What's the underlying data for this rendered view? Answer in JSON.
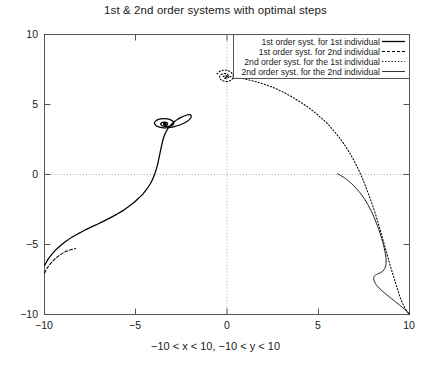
{
  "chart_data": {
    "type": "line",
    "title": "1st & 2nd order systems with optimal steps",
    "xlabel": "−10 < x < 10, −10 < y < 10",
    "ylabel": "",
    "xlim": [
      -10,
      10
    ],
    "ylim": [
      -10,
      10
    ],
    "grid": "zero-axes-dotted",
    "legend_position": "top-right-inside",
    "xticks": [
      "−10",
      "−5",
      "0",
      "5",
      "10"
    ],
    "xtick_values": [
      -10,
      -5,
      0,
      5,
      10
    ],
    "yticks": [
      "10",
      "5",
      "0",
      "−5",
      "−10"
    ],
    "ytick_values": [
      10,
      5,
      0,
      -5,
      -10
    ],
    "series": [
      {
        "name": "1st order syst. for 1st individual",
        "style": "solid",
        "points": [
          [
            -10.0,
            -6.5
          ],
          [
            -9.8,
            -6.05
          ],
          [
            -9.6,
            -5.7
          ],
          [
            -9.35,
            -5.35
          ],
          [
            -9.1,
            -5.05
          ],
          [
            -8.8,
            -4.75
          ],
          [
            -8.5,
            -4.48
          ],
          [
            -8.15,
            -4.22
          ],
          [
            -7.8,
            -3.98
          ],
          [
            -7.45,
            -3.76
          ],
          [
            -7.1,
            -3.55
          ],
          [
            -6.75,
            -3.33
          ],
          [
            -6.4,
            -3.1
          ],
          [
            -6.05,
            -2.85
          ],
          [
            -5.7,
            -2.58
          ],
          [
            -5.4,
            -2.3
          ],
          [
            -5.1,
            -2.0
          ],
          [
            -4.85,
            -1.7
          ],
          [
            -4.6,
            -1.38
          ],
          [
            -4.4,
            -1.05
          ],
          [
            -4.22,
            -0.7
          ],
          [
            -4.08,
            -0.35
          ],
          [
            -3.97,
            0.0
          ],
          [
            -3.88,
            0.35
          ],
          [
            -3.8,
            0.72
          ],
          [
            -3.74,
            1.1
          ],
          [
            -3.68,
            1.48
          ],
          [
            -3.62,
            1.85
          ],
          [
            -3.56,
            2.2
          ],
          [
            -3.5,
            2.52
          ],
          [
            -3.42,
            2.82
          ],
          [
            -3.32,
            3.1
          ],
          [
            -3.2,
            3.35
          ],
          [
            -3.05,
            3.58
          ],
          [
            -2.88,
            3.78
          ],
          [
            -2.7,
            3.95
          ],
          [
            -2.52,
            4.08
          ],
          [
            -2.35,
            4.18
          ],
          [
            -2.2,
            4.25
          ],
          [
            -2.08,
            4.28
          ],
          [
            -2.0,
            4.26
          ],
          [
            -1.96,
            4.18
          ],
          [
            -1.98,
            4.06
          ],
          [
            -2.06,
            3.92
          ],
          [
            -2.2,
            3.78
          ],
          [
            -2.4,
            3.64
          ],
          [
            -2.62,
            3.52
          ],
          [
            -2.86,
            3.43
          ],
          [
            -3.1,
            3.36
          ],
          [
            -3.34,
            3.33
          ],
          [
            -3.56,
            3.34
          ],
          [
            -3.74,
            3.4
          ],
          [
            -3.88,
            3.48
          ],
          [
            -3.96,
            3.6
          ],
          [
            -3.97,
            3.72
          ],
          [
            -3.9,
            3.83
          ],
          [
            -3.78,
            3.92
          ],
          [
            -3.62,
            3.97
          ],
          [
            -3.45,
            3.99
          ],
          [
            -3.28,
            3.97
          ],
          [
            -3.12,
            3.92
          ],
          [
            -3.0,
            3.84
          ],
          [
            -2.93,
            3.74
          ],
          [
            -2.92,
            3.64
          ],
          [
            -2.96,
            3.55
          ],
          [
            -3.06,
            3.48
          ],
          [
            -3.18,
            3.44
          ],
          [
            -3.32,
            3.43
          ],
          [
            -3.45,
            3.45
          ],
          [
            -3.56,
            3.5
          ],
          [
            -3.62,
            3.56
          ],
          [
            -3.63,
            3.63
          ],
          [
            -3.59,
            3.69
          ],
          [
            -3.51,
            3.73
          ],
          [
            -3.42,
            3.74
          ],
          [
            -3.33,
            3.72
          ],
          [
            -3.27,
            3.67
          ],
          [
            -3.25,
            3.61
          ],
          [
            -3.28,
            3.56
          ],
          [
            -3.34,
            3.53
          ],
          [
            -3.41,
            3.53
          ],
          [
            -3.46,
            3.56
          ],
          [
            -3.48,
            3.6
          ],
          [
            -3.46,
            3.64
          ],
          [
            -3.42,
            3.66
          ],
          [
            -3.38,
            3.65
          ],
          [
            -3.35,
            3.62
          ],
          [
            -3.36,
            3.59
          ],
          [
            -3.39,
            3.58
          ],
          [
            -3.42,
            3.59
          ],
          [
            -3.42,
            3.61
          ],
          [
            -3.4,
            3.61
          ]
        ]
      },
      {
        "name": "1st order syst. for 2nd individual",
        "style": "dashed",
        "points": [
          [
            -10.0,
            -7.05
          ],
          [
            -9.88,
            -6.75
          ],
          [
            -9.74,
            -6.48
          ],
          [
            -9.58,
            -6.24
          ],
          [
            -9.42,
            -6.03
          ],
          [
            -9.26,
            -5.85
          ],
          [
            -9.1,
            -5.7
          ],
          [
            -8.94,
            -5.57
          ],
          [
            -8.78,
            -5.47
          ],
          [
            -8.62,
            -5.4
          ],
          [
            -8.48,
            -5.34
          ],
          [
            -8.36,
            -5.31
          ],
          [
            -8.28,
            -5.3
          ]
        ]
      },
      {
        "name": "2nd order syst. for the 1st individual",
        "style": "dotted",
        "points": [
          [
            -0.55,
            7.18
          ],
          [
            -0.38,
            7.38
          ],
          [
            -0.14,
            7.46
          ],
          [
            0.1,
            7.4
          ],
          [
            0.28,
            7.22
          ],
          [
            0.34,
            6.98
          ],
          [
            0.26,
            6.78
          ],
          [
            0.08,
            6.66
          ],
          [
            -0.14,
            6.66
          ],
          [
            -0.32,
            6.76
          ],
          [
            -0.4,
            6.94
          ],
          [
            -0.36,
            7.1
          ],
          [
            -0.22,
            7.2
          ],
          [
            -0.06,
            7.2
          ],
          [
            0.06,
            7.12
          ],
          [
            0.1,
            7.0
          ],
          [
            0.04,
            6.9
          ],
          [
            -0.06,
            6.86
          ],
          [
            -0.16,
            6.9
          ],
          [
            -0.2,
            6.98
          ],
          [
            -0.16,
            7.05
          ],
          [
            -0.08,
            7.07
          ],
          [
            0.0,
            7.04
          ],
          [
            0.02,
            6.98
          ],
          [
            -0.02,
            6.94
          ],
          [
            -0.08,
            6.95
          ],
          [
            -0.1,
            6.99
          ],
          [
            -0.06,
            7.02
          ],
          [
            0.1,
            7.0
          ],
          [
            0.55,
            6.92
          ],
          [
            1.05,
            6.8
          ],
          [
            1.55,
            6.64
          ],
          [
            2.05,
            6.44
          ],
          [
            2.55,
            6.2
          ],
          [
            3.05,
            5.9
          ],
          [
            3.55,
            5.55
          ],
          [
            4.05,
            5.15
          ],
          [
            4.55,
            4.7
          ],
          [
            5.0,
            4.22
          ],
          [
            5.45,
            3.7
          ],
          [
            5.85,
            3.12
          ],
          [
            6.22,
            2.52
          ],
          [
            6.55,
            1.9
          ],
          [
            6.85,
            1.25
          ],
          [
            7.12,
            0.58
          ],
          [
            7.36,
            -0.1
          ],
          [
            7.58,
            -0.8
          ],
          [
            7.8,
            -1.55
          ],
          [
            8.0,
            -2.3
          ],
          [
            8.2,
            -3.1
          ],
          [
            8.38,
            -3.9
          ],
          [
            8.56,
            -4.72
          ],
          [
            8.74,
            -5.55
          ],
          [
            8.92,
            -6.4
          ],
          [
            9.12,
            -7.25
          ],
          [
            9.32,
            -8.1
          ],
          [
            9.54,
            -8.95
          ],
          [
            9.76,
            -9.55
          ],
          [
            10.0,
            -10.0
          ]
        ]
      },
      {
        "name": "2nd order syst. for the 2nd individual",
        "style": "solid-thin",
        "points": [
          [
            6.05,
            0.05
          ],
          [
            6.3,
            -0.12
          ],
          [
            6.55,
            -0.35
          ],
          [
            6.8,
            -0.62
          ],
          [
            7.05,
            -0.95
          ],
          [
            7.3,
            -1.32
          ],
          [
            7.52,
            -1.72
          ],
          [
            7.72,
            -2.15
          ],
          [
            7.9,
            -2.6
          ],
          [
            8.06,
            -3.05
          ],
          [
            8.2,
            -3.52
          ],
          [
            8.34,
            -4.0
          ],
          [
            8.46,
            -4.48
          ],
          [
            8.56,
            -4.95
          ],
          [
            8.64,
            -5.4
          ],
          [
            8.7,
            -5.82
          ],
          [
            8.72,
            -6.18
          ],
          [
            8.7,
            -6.48
          ],
          [
            8.64,
            -6.72
          ],
          [
            8.54,
            -6.9
          ],
          [
            8.4,
            -7.02
          ],
          [
            8.26,
            -7.1
          ],
          [
            8.14,
            -7.18
          ],
          [
            8.06,
            -7.3
          ],
          [
            8.04,
            -7.46
          ],
          [
            8.08,
            -7.66
          ],
          [
            8.18,
            -7.88
          ],
          [
            8.34,
            -8.12
          ],
          [
            8.54,
            -8.36
          ],
          [
            8.76,
            -8.6
          ],
          [
            9.0,
            -8.85
          ],
          [
            9.24,
            -9.1
          ],
          [
            9.48,
            -9.35
          ],
          [
            9.72,
            -9.62
          ],
          [
            9.88,
            -9.82
          ],
          [
            10.0,
            -10.0
          ]
        ]
      }
    ]
  },
  "legend": {
    "entries": [
      {
        "label": "1st order syst. for 1st individual",
        "style": "solid"
      },
      {
        "label": "1st order syst. for 2nd individual",
        "style": "dashed"
      },
      {
        "label": "2nd order syst. for the 1st individual",
        "style": "dotted"
      },
      {
        "label": "2nd order syst. for the 2nd individual",
        "style": "solid-thin"
      }
    ]
  },
  "colors": {
    "line": "#000000",
    "axis": "#555555",
    "grid": "#9a9a9a",
    "text": "#1a1a1a",
    "background": "#ffffff"
  }
}
